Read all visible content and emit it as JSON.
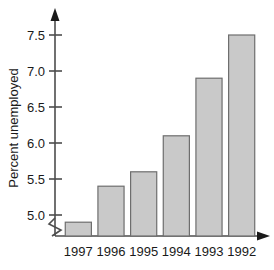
{
  "chart_data": {
    "type": "bar",
    "title": "",
    "subtitle": "",
    "xlabel": "",
    "ylabel": "Percent unemployed",
    "categories": [
      "1997",
      "1996",
      "1995",
      "1994",
      "1993",
      "1992"
    ],
    "values": [
      4.9,
      5.4,
      5.6,
      6.1,
      6.9,
      7.5
    ],
    "series": [
      {
        "name": "Percent unemployed",
        "values": [
          4.9,
          5.4,
          5.6,
          6.1,
          6.9,
          7.5
        ]
      }
    ],
    "ylim": [
      4.75,
      7.75
    ],
    "ytick_labels": [
      "5.0",
      "5.5",
      "6.0",
      "6.5",
      "7.0",
      "7.5"
    ],
    "ytick_values": [
      5.0,
      5.5,
      6.0,
      6.5,
      7.0,
      7.5
    ],
    "grid": false,
    "legend": null,
    "legend_position": "none",
    "axis_break": true,
    "axis_break_note": "zigzag break on y-axis below 5.0",
    "bar_fill_color": "#c9c9c9",
    "bar_edge_color": "#6e6e6e",
    "axis_color": "#4d4d4d",
    "text_color": "#1a1a1a",
    "background_color": "#ffffff"
  },
  "axis": {
    "y_title": "Percent unemployed"
  }
}
